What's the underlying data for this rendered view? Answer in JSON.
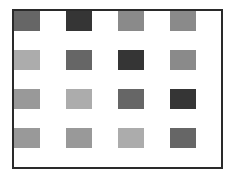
{
  "grid": {
    "rows": 4,
    "cols": 4,
    "cells": [
      [
        "#666666",
        "#353535",
        "#8a8a8a",
        "#8a8a8a"
      ],
      [
        "#acacac",
        "#666666",
        "#353535",
        "#8a8a8a"
      ],
      [
        "#999999",
        "#acacac",
        "#666666",
        "#353535"
      ],
      [
        "#999999",
        "#999999",
        "#acacac",
        "#666666"
      ]
    ]
  }
}
